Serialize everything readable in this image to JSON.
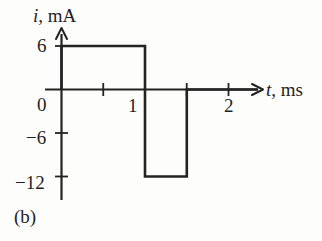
{
  "figure": {
    "caption": "(b)",
    "background_color": "#fdfdfb",
    "ink_color": "#232323"
  },
  "axis_labels": {
    "y_variable": "i",
    "y_separator": ", ",
    "y_unit": "mA",
    "x_variable": "t",
    "x_separator": ", ",
    "x_unit": "ms"
  },
  "ticks": {
    "y": [
      {
        "label": "6",
        "value": 6
      },
      {
        "label": "0",
        "value": 0
      },
      {
        "label": "−6",
        "value": -6
      },
      {
        "label": "−12",
        "value": -12
      }
    ],
    "x": [
      {
        "label": "",
        "value": 0.5
      },
      {
        "label": "1",
        "value": 1
      },
      {
        "label": "",
        "value": 1.5
      },
      {
        "label": "2",
        "value": 2
      }
    ]
  },
  "chart_data": {
    "type": "line",
    "title": "",
    "subtitle": "",
    "xlabel": "t, ms",
    "ylabel": "i, mA",
    "xlim": [
      0,
      2.35
    ],
    "ylim": [
      -13.5,
      7.5
    ],
    "grid": false,
    "legend": null,
    "annotations": [
      "(b)"
    ],
    "x_tick_values": [
      0,
      0.5,
      1,
      1.5,
      2
    ],
    "x_tick_labels": [
      "0",
      "",
      "1",
      "",
      "2"
    ],
    "y_tick_values": [
      6,
      0,
      -6,
      -12
    ],
    "y_tick_labels": [
      "6",
      "0",
      "−6",
      "−12"
    ],
    "waveform_description": "Periodic square-like current pulse train",
    "series": [
      {
        "name": "i(t)",
        "style": "step",
        "x": [
          0,
          0,
          1,
          1,
          1.5,
          1.5,
          2.35
        ],
        "y": [
          0,
          6,
          6,
          -12,
          -12,
          0,
          0
        ],
        "segments": [
          {
            "from_t": 0,
            "to_t": 1,
            "value": 6
          },
          {
            "from_t": 1,
            "to_t": 1.5,
            "value": -12
          },
          {
            "from_t": 1.5,
            "to_t": 2.35,
            "value": 0
          }
        ]
      }
    ]
  },
  "geometry": {
    "origin_x_px": 61.5,
    "origin_y_px": 89.5,
    "px_per_ms": 83.5,
    "px_per_mA": 7.25,
    "y_axis_top_px": 28,
    "y_axis_bottom_px": 200,
    "x_axis_left_px": 45,
    "x_axis_right_px": 262
  }
}
